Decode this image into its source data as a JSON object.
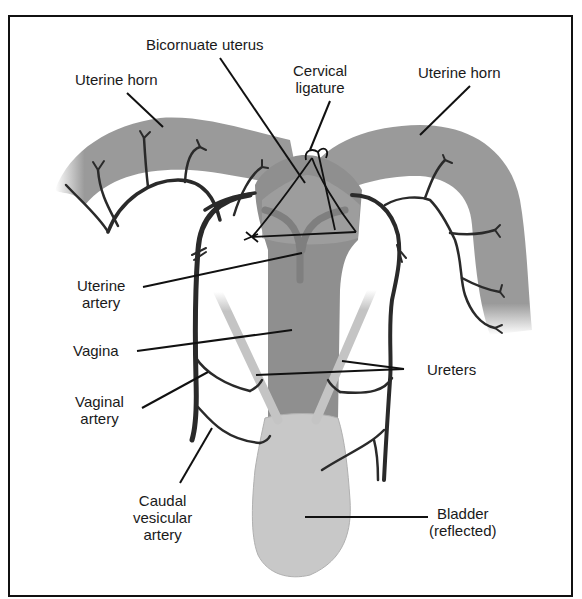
{
  "diagram": {
    "type": "anatomical illustration",
    "colors": {
      "uterus_tissue": "#9a9a9a",
      "vagina_body": "#8f8f8f",
      "bladder": "#c8c8c8",
      "ureter": "#c4c4c4",
      "artery": "#2a2a2a",
      "leader_line": "#111111",
      "border": "#111111"
    },
    "labels": {
      "uterine_horn_left": "Uterine horn",
      "bicornuate_uterus": "Bicornuate uterus",
      "cervical_ligature_line1": "Cervical",
      "cervical_ligature_line2": "ligature",
      "uterine_horn_right": "Uterine horn",
      "uterine_artery_line1": "Uterine",
      "uterine_artery_line2": "artery",
      "vagina": "Vagina",
      "vaginal_artery_line1": "Vaginal",
      "vaginal_artery_line2": "artery",
      "ureters": "Ureters",
      "caudal_vesicular_artery_line1": "Caudal",
      "caudal_vesicular_artery_line2": "vesicular",
      "caudal_vesicular_artery_line3": "artery",
      "bladder_line1": "Bladder",
      "bladder_line2": "(reflected)"
    }
  }
}
